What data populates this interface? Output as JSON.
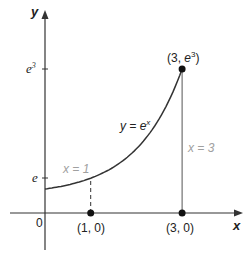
{
  "diagram": {
    "x_axis_label": "x",
    "y_axis_label": "y",
    "origin_label": "0",
    "y_ticks": [
      {
        "label_base": "e",
        "label_sup": "",
        "value": 2.718
      },
      {
        "label_base": "e",
        "label_sup": "3",
        "value": 20.086
      }
    ],
    "curve": {
      "label_prefix": "y = e",
      "label_sup": "x",
      "function": "exp",
      "x_start": 0,
      "x_end": 3
    },
    "lines": [
      {
        "label": "x = 1",
        "x": 1,
        "style": "dashed"
      },
      {
        "label": "x = 3",
        "x": 3,
        "style": "solid"
      }
    ],
    "points": [
      {
        "label": "(1, 0)",
        "x": 1,
        "y": 0
      },
      {
        "label": "(3, 0)",
        "x": 3,
        "y": 0
      },
      {
        "label_prefix": "(3, ",
        "label_base": "e",
        "label_sup": "3",
        "label_suffix": ")",
        "x": 3,
        "y": 20.086
      }
    ],
    "colors": {
      "axis": "#333333",
      "curve": "#333333",
      "line_label": "#a0a0a0",
      "point": "#111111"
    }
  }
}
